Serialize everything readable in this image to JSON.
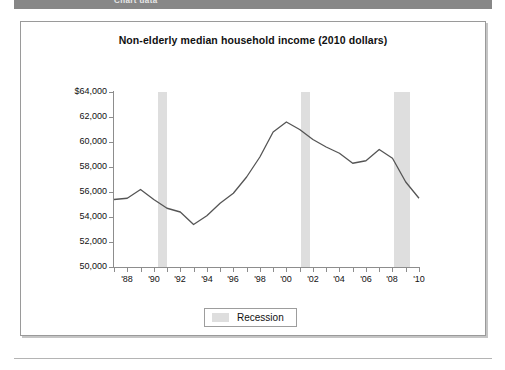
{
  "banner": {
    "label": "Chart data"
  },
  "figure": {
    "title": "Non-elderly median household income (2010 dollars)",
    "legend": {
      "label": "Recession",
      "swatch_color": "#dedede"
    }
  },
  "chart_data": {
    "type": "line",
    "title": "Non-elderly median household income (2010 dollars)",
    "xlabel": "",
    "ylabel": "",
    "grid": false,
    "legend_position": "bottom-center",
    "line_color": "#555555",
    "xlim": [
      1987,
      2010
    ],
    "ylim": [
      50000,
      64000
    ],
    "y_ticks": [
      50000,
      52000,
      54000,
      56000,
      58000,
      60000,
      62000,
      64000
    ],
    "y_tick_labels": [
      "50,000",
      "52,000",
      "54,000",
      "56,000",
      "58,000",
      "60,000",
      "62,000",
      "$64,000"
    ],
    "x_ticks": [
      1987,
      1988,
      1989,
      1990,
      1991,
      1992,
      1993,
      1994,
      1995,
      1996,
      1997,
      1998,
      1999,
      2000,
      2001,
      2002,
      2003,
      2004,
      2005,
      2006,
      2007,
      2008,
      2009,
      2010
    ],
    "x_tick_labels": [
      "",
      "'88",
      "",
      "'90",
      "",
      "'92",
      "",
      "'94",
      "",
      "'96",
      "",
      "'98",
      "",
      "'00",
      "",
      "'02",
      "",
      "'04",
      "",
      "'06",
      "",
      "'08",
      "",
      "'10"
    ],
    "x": [
      1987,
      1988,
      1989,
      1990,
      1991,
      1992,
      1993,
      1994,
      1995,
      1996,
      1997,
      1998,
      1999,
      2000,
      2001,
      2002,
      2003,
      2004,
      2005,
      2006,
      2007,
      2008,
      2009,
      2010
    ],
    "y": [
      55400,
      55500,
      56200,
      55400,
      54700,
      54400,
      53400,
      54100,
      55100,
      55900,
      57200,
      58800,
      60800,
      61600,
      61000,
      60200,
      59600,
      59100,
      58300,
      58500,
      59400,
      58700,
      56800,
      55500
    ],
    "series": [
      {
        "name": "Non-elderly median household income (2010 dollars)",
        "values": [
          55400,
          55500,
          56200,
          55400,
          54700,
          54400,
          53400,
          54100,
          55100,
          55900,
          57200,
          58800,
          60800,
          61600,
          61000,
          60200,
          59600,
          59100,
          58300,
          58500,
          59400,
          58700,
          56800,
          55500
        ]
      }
    ],
    "shaded_regions": [
      {
        "label": "Recession",
        "start": 1990.3,
        "end": 1991.0,
        "color": "#dedede"
      },
      {
        "label": "Recession",
        "start": 2001.1,
        "end": 2001.8,
        "color": "#dedede"
      },
      {
        "label": "Recession",
        "start": 2008.1,
        "end": 2009.3,
        "color": "#dedede"
      }
    ]
  }
}
